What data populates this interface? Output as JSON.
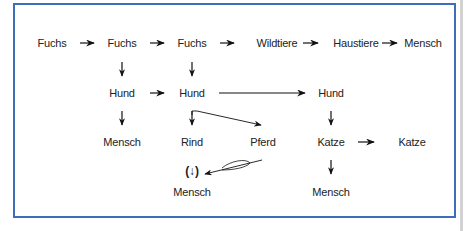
{
  "diagram": {
    "type": "lineage-flow",
    "frame_color": "#3d6fb8",
    "arrow_color": "#111111",
    "nodes": [
      {
        "id": "fuchs_1",
        "label": "Fuchs",
        "x": 52,
        "y": 43
      },
      {
        "id": "fuchs_2",
        "label": "Fuchs",
        "x": 122,
        "y": 43
      },
      {
        "id": "fuchs_3",
        "label": "Fuchs",
        "x": 192,
        "y": 43
      },
      {
        "id": "wildtiere",
        "label": "Wildtiere",
        "x": 277,
        "y": 43
      },
      {
        "id": "haustiere",
        "label": "Haustiere",
        "x": 356,
        "y": 43
      },
      {
        "id": "mensch_top",
        "label": "Mensch",
        "x": 423,
        "y": 43
      },
      {
        "id": "hund_1",
        "label": "Hund",
        "x": 122,
        "y": 93
      },
      {
        "id": "hund_2",
        "label": "Hund",
        "x": 192,
        "y": 93
      },
      {
        "id": "hund_3",
        "label": "Hund",
        "x": 331,
        "y": 93
      },
      {
        "id": "mensch_left",
        "label": "Mensch",
        "x": 122,
        "y": 142
      },
      {
        "id": "rind",
        "label": "Rind",
        "x": 192,
        "y": 142
      },
      {
        "id": "pferd",
        "label": "Pferd",
        "x": 263,
        "y": 142
      },
      {
        "id": "katze_1",
        "label": "Katze",
        "x": 331,
        "y": 142
      },
      {
        "id": "katze_2",
        "label": "Katze",
        "x": 412,
        "y": 142
      },
      {
        "id": "paren_arrow",
        "label": "(↓)",
        "x": 192,
        "y": 171
      },
      {
        "id": "mensch_bottom_mid",
        "label": "Mensch",
        "x": 192,
        "y": 192
      },
      {
        "id": "mensch_bottom_right",
        "label": "Mensch",
        "x": 331,
        "y": 192
      }
    ],
    "edges": [
      {
        "from": "fuchs_1",
        "to": "fuchs_2",
        "style": "short-horizontal"
      },
      {
        "from": "fuchs_2",
        "to": "fuchs_3",
        "style": "short-horizontal"
      },
      {
        "from": "fuchs_3",
        "to": "wildtiere",
        "style": "short-horizontal"
      },
      {
        "from": "wildtiere",
        "to": "haustiere",
        "style": "short-horizontal"
      },
      {
        "from": "haustiere",
        "to": "mensch_top",
        "style": "short-horizontal"
      },
      {
        "from": "fuchs_2",
        "to": "hund_1",
        "style": "short-vertical"
      },
      {
        "from": "fuchs_3",
        "to": "hund_2",
        "style": "short-vertical"
      },
      {
        "from": "hund_1",
        "to": "hund_2",
        "style": "short-horizontal"
      },
      {
        "from": "hund_2",
        "to": "hund_3",
        "style": "long-horizontal"
      },
      {
        "from": "hund_1",
        "to": "mensch_left",
        "style": "short-vertical"
      },
      {
        "from": "hund_2",
        "to": "rind",
        "style": "short-vertical"
      },
      {
        "from": "hund_2",
        "to": "pferd",
        "style": "diagonal"
      },
      {
        "from": "hund_3",
        "to": "katze_1",
        "style": "short-vertical"
      },
      {
        "from": "katze_1",
        "to": "katze_2",
        "style": "short-horizontal"
      },
      {
        "from": "katze_1",
        "to": "mensch_bottom_right",
        "style": "short-vertical"
      },
      {
        "from": "pferd",
        "to": "paren_arrow",
        "style": "diagonal-with-loop"
      }
    ]
  }
}
